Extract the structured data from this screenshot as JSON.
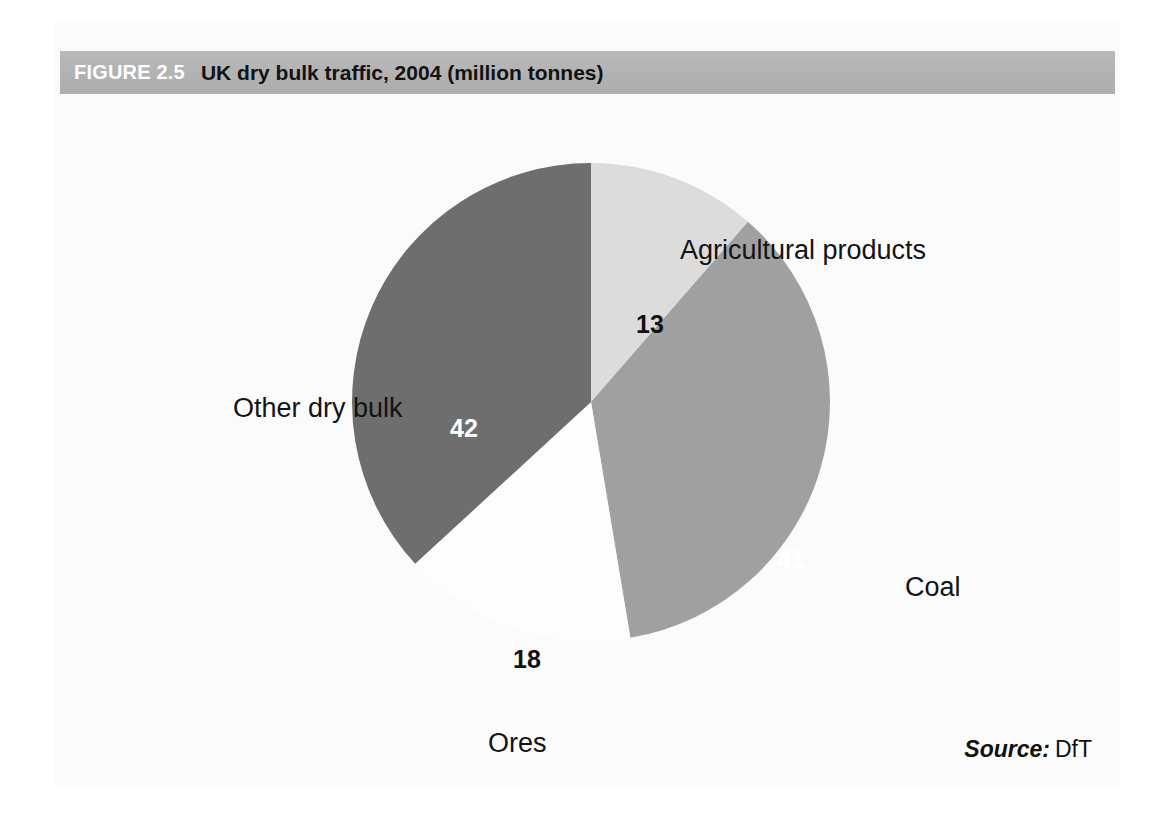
{
  "figure": {
    "number": "FIGURE 2.5",
    "title": "UK dry bulk traffic, 2004 (million tonnes)",
    "source_label": "Source:",
    "source_value": "DfT"
  },
  "colors": {
    "title_bar": "#b4b4b4",
    "figure_number_text": "#ffffff",
    "figure_title_text": "#121212",
    "agricultural": "#dcdcdc",
    "coal": "#a0a0a0",
    "ores": "#fdfdfd",
    "other_dry_bulk": "#6e6e6e",
    "page_background": "#ffffff"
  },
  "chart_data": {
    "type": "pie",
    "title": "UK dry bulk traffic, 2004 (million tonnes)",
    "unit": "million tonnes",
    "year": "2004",
    "total": 114,
    "categories": [
      "Agricultural products",
      "Coal",
      "Ores",
      "Other dry bulk"
    ],
    "values": [
      13,
      41,
      18,
      42
    ],
    "labels": [
      "13",
      "41",
      "18",
      "42"
    ],
    "slice_colors": [
      "#dcdcdc",
      "#a0a0a0",
      "#fdfdfd",
      "#6e6e6e"
    ],
    "start_angle_deg": 0,
    "direction": "clockwise",
    "legend": "none",
    "label_placement": "inside values, outside category names",
    "slices": [
      {
        "name": "Agricultural products",
        "value": 13,
        "value_text": "13",
        "color": "#dcdcdc",
        "value_text_color": "#121212",
        "percent": 11.4,
        "start_deg": 0,
        "sweep_deg": 41.05
      },
      {
        "name": "Coal",
        "value": 41,
        "value_text": "41",
        "color": "#a0a0a0",
        "value_text_color": "#ffffff",
        "percent": 36.0,
        "start_deg": 41.05,
        "sweep_deg": 129.47
      },
      {
        "name": "Ores",
        "value": 18,
        "value_text": "18",
        "color": "#fdfdfd",
        "value_text_color": "#121212",
        "percent": 15.8,
        "start_deg": 170.53,
        "sweep_deg": 56.84
      },
      {
        "name": "Other dry bulk",
        "value": 42,
        "value_text": "42",
        "color": "#6e6e6e",
        "value_text_color": "#ffffff",
        "percent": 36.8,
        "start_deg": 227.37,
        "sweep_deg": 132.63
      }
    ]
  }
}
